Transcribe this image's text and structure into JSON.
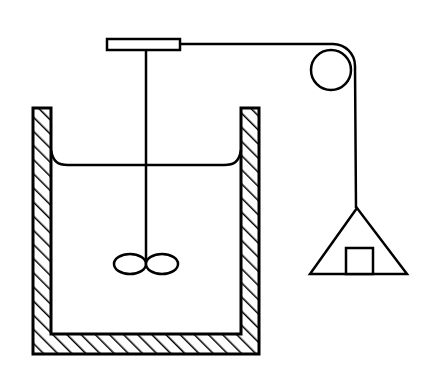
{
  "diagram": {
    "components": [
      {
        "id": "container",
        "label": "hatched container walls"
      },
      {
        "id": "liquid-surface",
        "label": "liquid surface with meniscus"
      },
      {
        "id": "stirrer-shaft",
        "label": "stirrer shaft"
      },
      {
        "id": "paddle",
        "label": "paddle blades"
      },
      {
        "id": "drum",
        "label": "horizontal drum / axle"
      },
      {
        "id": "string",
        "label": "string"
      },
      {
        "id": "pulley",
        "label": "pulley"
      },
      {
        "id": "pan",
        "label": "triangular weight pan"
      },
      {
        "id": "mass",
        "label": "mass block"
      }
    ],
    "colors": {
      "stroke": "#000000",
      "background": "#ffffff"
    }
  }
}
